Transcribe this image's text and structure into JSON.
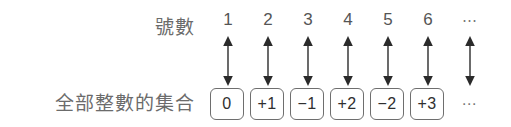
{
  "diagram": {
    "title_rows": {
      "index_label": "號數",
      "set_label": "全部整數的集合"
    },
    "colors": {
      "background": "#ffffff",
      "label_text": "#6b6b6b",
      "box_border": "#6e6e6e",
      "box_fill": "#ffffff",
      "arrow": "#2b2b2b",
      "value_text": "#2f2f2f",
      "ellipsis_text": "#777777"
    },
    "ellipsis_glyph": "⋯",
    "columns": [
      {
        "index": "1",
        "value": "0",
        "arrow": "double-headed-vertical-arrow",
        "has_box": true
      },
      {
        "index": "2",
        "value": "+1",
        "arrow": "double-headed-vertical-arrow",
        "has_box": true
      },
      {
        "index": "3",
        "value": "−1",
        "arrow": "double-headed-vertical-arrow",
        "has_box": true
      },
      {
        "index": "4",
        "value": "+2",
        "arrow": "double-headed-vertical-arrow",
        "has_box": true
      },
      {
        "index": "5",
        "value": "−2",
        "arrow": "double-headed-vertical-arrow",
        "has_box": true
      },
      {
        "index": "6",
        "value": "+3",
        "arrow": "double-headed-vertical-arrow",
        "has_box": true
      },
      {
        "index": "⋯",
        "value": "⋯",
        "arrow": "double-headed-vertical-arrow",
        "has_box": false
      }
    ]
  }
}
